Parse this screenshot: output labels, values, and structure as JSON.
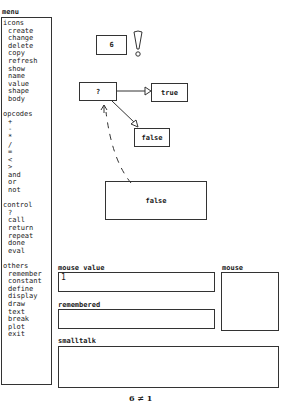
{
  "menu": {
    "title": "menu",
    "sections": [
      {
        "label": "icons",
        "items": [
          "create",
          "change",
          "delete",
          "copy",
          "refresh",
          "show",
          "name",
          "value",
          "shape",
          "body"
        ]
      },
      {
        "label": "opcodes",
        "items": [
          "+",
          "-",
          "*",
          "/",
          "=",
          "<",
          ">",
          "and",
          "or",
          "not"
        ]
      },
      {
        "label": "control",
        "items": [
          "?",
          "call",
          "return",
          "repeat",
          "done",
          "eval"
        ]
      },
      {
        "label": "others",
        "items": [
          "remember",
          "constant",
          "define",
          "display",
          "draw",
          "text",
          "break",
          "plot",
          "exit"
        ]
      }
    ]
  },
  "canvas": {
    "constant_node": {
      "label": "6"
    },
    "exclamation": {
      "glyph": "!"
    },
    "condition_node": {
      "label": "?"
    },
    "true_node": {
      "label": "true"
    },
    "false_node_small": {
      "label": "false"
    },
    "false_node_large": {
      "label": "false"
    }
  },
  "panels": {
    "mouse_value": {
      "label": "mouse value",
      "value": "1"
    },
    "remembered": {
      "label": "remembered",
      "value": ""
    },
    "mouse": {
      "label": "mouse"
    },
    "smalltalk": {
      "label": "smalltalk",
      "value": ""
    }
  },
  "footer": {
    "status": "6 ≠ 1"
  },
  "colors": {
    "ink": "#1a1a1a",
    "background": "#ffffff"
  }
}
